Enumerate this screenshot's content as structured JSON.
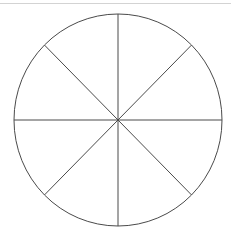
{
  "page": {
    "background_color": "#ffffff",
    "width": 231,
    "height": 236
  },
  "separator": {
    "name": "top-separator",
    "color": "#d3d3d3",
    "thickness": 1,
    "y": 3
  },
  "figure": {
    "label": "Circle divided into eight equal sectors",
    "stroke_color": "#4a4a4a",
    "fill_color": "none",
    "stroke_width": 1
  },
  "chart_data": {
    "type": "pie",
    "title": "",
    "subtitle": "",
    "xlabel": "",
    "ylabel": "",
    "grid": false,
    "legend": false,
    "legend_position": "none",
    "center_x": 118,
    "center_y": 120,
    "radius_x": 104,
    "radius_y": 106,
    "slice_count": 8,
    "categories": [
      "Sector 1",
      "Sector 2",
      "Sector 3",
      "Sector 4",
      "Sector 5",
      "Sector 6",
      "Sector 7",
      "Sector 8"
    ],
    "values": [
      12.5,
      12.5,
      12.5,
      12.5,
      12.5,
      12.5,
      12.5,
      12.5
    ],
    "value_unit": "percent",
    "fraction_each": "1/8",
    "slice_angle_degrees": 45,
    "annotations": [],
    "diameters": [
      {
        "name": "vertical-diameter",
        "angle_degrees": 90
      },
      {
        "name": "horizontal-diameter",
        "angle_degrees": 0
      },
      {
        "name": "diagonal-diameter-nesw",
        "angle_degrees": 45
      },
      {
        "name": "diagonal-diameter-nwse",
        "angle_degrees": 135
      }
    ],
    "colors": {
      "stroke": "#4a4a4a",
      "fill": "#ffffff",
      "separator": "#d3d3d3"
    }
  }
}
